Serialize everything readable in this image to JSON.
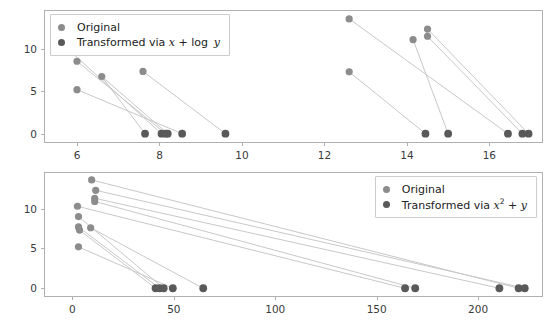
{
  "figure": {
    "kind": "two-panel-scatter-with-connectors",
    "background": "#ffffff",
    "colors": {
      "original": "#8c8c8c",
      "transformed": "#595959",
      "connector": "#c8c8c8",
      "frame": "#b0b0b0",
      "tick_text": "#3a3a3a"
    }
  },
  "panels": [
    {
      "id": "top",
      "legend": {
        "position": "upper-left",
        "entries": [
          {
            "label": "Original",
            "color_key": "original"
          },
          {
            "label": "Transformed via x + log y",
            "color_key": "transformed",
            "math": true
          }
        ]
      },
      "axes": {
        "xticks": [
          6,
          8,
          10,
          12,
          14,
          16
        ],
        "xticklabels": [
          "6",
          "8",
          "10",
          "12",
          "14",
          "16"
        ],
        "yticks": [
          0,
          5,
          10
        ],
        "yticklabels": [
          "0",
          "5",
          "10"
        ],
        "xlim": [
          5.2,
          17.3
        ],
        "ylim": [
          -1.1,
          14.6
        ],
        "xlabel": "",
        "ylabel": "",
        "grid": false
      }
    },
    {
      "id": "bottom",
      "legend": {
        "position": "upper-right",
        "entries": [
          {
            "label": "Original",
            "color_key": "original"
          },
          {
            "label": "Transformed via x² + y",
            "color_key": "transformed",
            "math": true
          }
        ]
      },
      "axes": {
        "xticks": [
          0,
          50,
          100,
          150,
          200
        ],
        "xticklabels": [
          "0",
          "50",
          "100",
          "150",
          "200"
        ],
        "yticks": [
          0,
          5,
          10
        ],
        "yticklabels": [
          "0",
          "5",
          "10"
        ],
        "xlim": [
          -14,
          232
        ],
        "ylim": [
          -1.1,
          14.6
        ],
        "xlabel": "",
        "ylabel": "",
        "grid": false
      }
    }
  ],
  "chart_data": [
    {
      "type": "scatter",
      "panel": "top",
      "title": "",
      "xlabel": "",
      "ylabel": "",
      "xlim": [
        5.2,
        17.3
      ],
      "ylim": [
        -1.1,
        14.6
      ],
      "grid": false,
      "legend_position": "upper left",
      "legend": [
        "Original",
        "Transformed via x + log y"
      ],
      "series": [
        {
          "name": "Original",
          "color": "#8c8c8c",
          "points": [
            {
              "x": 5.75,
              "y": 10.1
            },
            {
              "x": 6.0,
              "y": 8.55
            },
            {
              "x": 6.6,
              "y": 6.75
            },
            {
              "x": 6.0,
              "y": 5.2
            },
            {
              "x": 7.6,
              "y": 7.35
            },
            {
              "x": 12.6,
              "y": 13.55
            },
            {
              "x": 14.5,
              "y": 12.35
            },
            {
              "x": 14.5,
              "y": 11.5
            },
            {
              "x": 14.15,
              "y": 11.1
            },
            {
              "x": 12.6,
              "y": 7.3
            }
          ]
        },
        {
          "name": "Transformed via x + log y",
          "color": "#595959",
          "points": [
            {
              "x": 8.05,
              "y": 0.0
            },
            {
              "x": 8.15,
              "y": 0.0
            },
            {
              "x": 8.2,
              "y": 0.0
            },
            {
              "x": 7.65,
              "y": 0.0
            },
            {
              "x": 8.55,
              "y": 0.0
            },
            {
              "x": 9.6,
              "y": 0.0
            },
            {
              "x": 16.8,
              "y": 0.0
            },
            {
              "x": 16.95,
              "y": 0.0
            },
            {
              "x": 16.45,
              "y": 0.0
            },
            {
              "x": 14.45,
              "y": 0.0
            },
            {
              "x": 15.0,
              "y": 0.0
            }
          ]
        }
      ],
      "connectors": [
        {
          "from": {
            "x": 5.75,
            "y": 10.1
          },
          "to": {
            "x": 8.05,
            "y": 0.0
          }
        },
        {
          "from": {
            "x": 6.0,
            "y": 8.55
          },
          "to": {
            "x": 8.15,
            "y": 0.0
          }
        },
        {
          "from": {
            "x": 6.6,
            "y": 6.75
          },
          "to": {
            "x": 7.65,
            "y": 0.0
          }
        },
        {
          "from": {
            "x": 6.6,
            "y": 6.75
          },
          "to": {
            "x": 8.2,
            "y": 0.0
          }
        },
        {
          "from": {
            "x": 6.0,
            "y": 5.2
          },
          "to": {
            "x": 8.55,
            "y": 0.0
          }
        },
        {
          "from": {
            "x": 7.6,
            "y": 7.35
          },
          "to": {
            "x": 9.6,
            "y": 0.0
          }
        },
        {
          "from": {
            "x": 12.6,
            "y": 13.55
          },
          "to": {
            "x": 16.45,
            "y": 0.0
          }
        },
        {
          "from": {
            "x": 14.5,
            "y": 12.35
          },
          "to": {
            "x": 16.95,
            "y": 0.0
          }
        },
        {
          "from": {
            "x": 14.5,
            "y": 11.5
          },
          "to": {
            "x": 16.8,
            "y": 0.0
          }
        },
        {
          "from": {
            "x": 14.15,
            "y": 11.1
          },
          "to": {
            "x": 15.0,
            "y": 0.0
          }
        },
        {
          "from": {
            "x": 12.6,
            "y": 7.3
          },
          "to": {
            "x": 14.45,
            "y": 0.0
          }
        }
      ]
    },
    {
      "type": "scatter",
      "panel": "bottom",
      "title": "",
      "xlabel": "",
      "ylabel": "",
      "xlim": [
        -14,
        232
      ],
      "ylim": [
        -1.1,
        14.6
      ],
      "grid": false,
      "legend_position": "upper right",
      "legend": [
        "Original",
        "Transformed via x² + y"
      ],
      "series": [
        {
          "name": "Original",
          "color": "#8c8c8c",
          "points": [
            {
              "x": 9.5,
              "y": 13.6
            },
            {
              "x": 11.5,
              "y": 12.3
            },
            {
              "x": 11.0,
              "y": 11.3
            },
            {
              "x": 11.0,
              "y": 10.9
            },
            {
              "x": 2.5,
              "y": 10.3
            },
            {
              "x": 3.0,
              "y": 9.0
            },
            {
              "x": 3.0,
              "y": 7.7
            },
            {
              "x": 3.5,
              "y": 7.3
            },
            {
              "x": 9.0,
              "y": 7.6
            },
            {
              "x": 3.0,
              "y": 5.2
            }
          ]
        },
        {
          "name": "Transformed via x² + y",
          "color": "#595959",
          "points": [
            {
              "x": 41.0,
              "y": 0.0
            },
            {
              "x": 43.0,
              "y": 0.0
            },
            {
              "x": 45.0,
              "y": 0.0
            },
            {
              "x": 49.5,
              "y": 0.0
            },
            {
              "x": 64.5,
              "y": 0.0
            },
            {
              "x": 164.0,
              "y": 0.0
            },
            {
              "x": 169.0,
              "y": 0.0
            },
            {
              "x": 210.5,
              "y": 0.0
            },
            {
              "x": 220.0,
              "y": 0.0
            },
            {
              "x": 223.0,
              "y": 0.0
            }
          ]
        }
      ],
      "connectors": [
        {
          "from": {
            "x": 9.5,
            "y": 13.6
          },
          "to": {
            "x": 220.0,
            "y": 0.0
          }
        },
        {
          "from": {
            "x": 11.5,
            "y": 12.3
          },
          "to": {
            "x": 223.0,
            "y": 0.0
          }
        },
        {
          "from": {
            "x": 11.0,
            "y": 11.3
          },
          "to": {
            "x": 210.5,
            "y": 0.0
          }
        },
        {
          "from": {
            "x": 11.0,
            "y": 10.9
          },
          "to": {
            "x": 169.0,
            "y": 0.0
          }
        },
        {
          "from": {
            "x": 2.5,
            "y": 10.3
          },
          "to": {
            "x": 164.0,
            "y": 0.0
          }
        },
        {
          "from": {
            "x": 3.0,
            "y": 9.0
          },
          "to": {
            "x": 45.0,
            "y": 0.0
          }
        },
        {
          "from": {
            "x": 3.0,
            "y": 7.7
          },
          "to": {
            "x": 43.0,
            "y": 0.0
          }
        },
        {
          "from": {
            "x": 3.5,
            "y": 7.3
          },
          "to": {
            "x": 41.0,
            "y": 0.0
          }
        },
        {
          "from": {
            "x": 9.0,
            "y": 7.6
          },
          "to": {
            "x": 64.5,
            "y": 0.0
          }
        },
        {
          "from": {
            "x": 3.0,
            "y": 5.2
          },
          "to": {
            "x": 49.5,
            "y": 0.0
          }
        }
      ]
    }
  ]
}
